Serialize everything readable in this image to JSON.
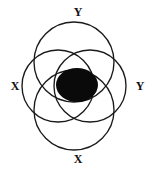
{
  "figure": {
    "name": "four-circle-overlap-diagram",
    "background_color": "#ffffff",
    "stroke_color": "#1a1a1a",
    "fill_color": "#0a0a0a",
    "labels": {
      "top": "Y",
      "left": "X",
      "right": "Y",
      "bottom": "X"
    },
    "circles": [
      {
        "name": "top-circle",
        "cx": 74,
        "cy": 62,
        "r": 40
      },
      {
        "name": "bottom-circle",
        "cx": 74,
        "cy": 110,
        "r": 40
      },
      {
        "name": "left-circle",
        "cx": 58,
        "cy": 86,
        "r": 36
      },
      {
        "name": "right-circle",
        "cx": 90,
        "cy": 86,
        "r": 36
      }
    ],
    "center_region": {
      "name": "intersection-ellipse",
      "cx": 77,
      "cy": 85,
      "rx": 21,
      "ry": 17
    }
  }
}
